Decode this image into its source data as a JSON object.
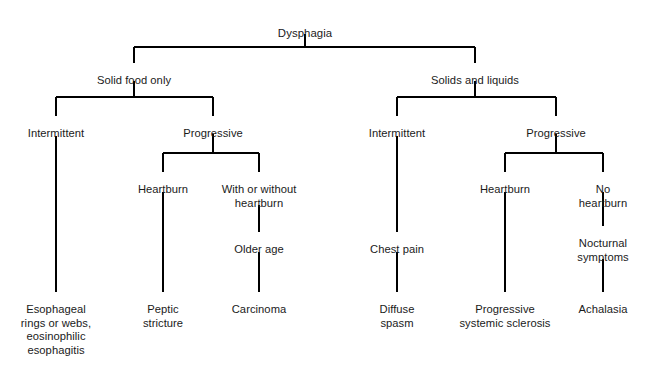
{
  "diagram": {
    "title": "Dysphagia",
    "type": "decision-tree",
    "colors": {
      "text": "#1a1a1a",
      "connector": "#000000",
      "background": "#ffffff"
    },
    "nodes": [
      {
        "id": "dysphagia",
        "label": "Dysphagia",
        "x": 305,
        "y": 27,
        "level": 0
      },
      {
        "id": "solid-food-only",
        "label": "Solid food only",
        "x": 134,
        "y": 74,
        "level": 1
      },
      {
        "id": "solids-and-liquids",
        "label": "Solids and liquids",
        "x": 475,
        "y": 74,
        "level": 1
      },
      {
        "id": "left-intermittent",
        "label": "Intermittent",
        "x": 56,
        "y": 127,
        "level": 2
      },
      {
        "id": "left-progressive",
        "label": "Progressive",
        "x": 213,
        "y": 127,
        "level": 2
      },
      {
        "id": "right-intermittent",
        "label": "Intermittent",
        "x": 397,
        "y": 127,
        "level": 2
      },
      {
        "id": "right-progressive",
        "label": "Progressive",
        "x": 556,
        "y": 127,
        "level": 2
      },
      {
        "id": "left-heartburn",
        "label": "Heartburn",
        "x": 163,
        "y": 183,
        "level": 3
      },
      {
        "id": "with-or-without",
        "label": "With or without\nheartburn",
        "x": 259,
        "y": 183,
        "level": 3
      },
      {
        "id": "right-heartburn",
        "label": "Heartburn",
        "x": 505,
        "y": 183,
        "level": 3
      },
      {
        "id": "no-heartburn",
        "label": "No heartburn",
        "x": 603,
        "y": 183,
        "level": 3
      },
      {
        "id": "older-age",
        "label": "Older age",
        "x": 259,
        "y": 243,
        "level": 4
      },
      {
        "id": "chest-pain",
        "label": "Chest pain",
        "x": 397,
        "y": 243,
        "level": 4
      },
      {
        "id": "nocturnal-symptoms",
        "label": "Nocturnal\nsymptoms",
        "x": 603,
        "y": 237,
        "level": 4
      },
      {
        "id": "esophageal-rings",
        "label": "Esophageal\nrings or webs,\neosinophilic\nesophagitis",
        "x": 56,
        "y": 303,
        "level": 5
      },
      {
        "id": "peptic-stricture",
        "label": "Peptic\nstricture",
        "x": 163,
        "y": 303,
        "level": 5
      },
      {
        "id": "carcinoma",
        "label": "Carcinoma",
        "x": 259,
        "y": 303,
        "level": 5
      },
      {
        "id": "diffuse-spasm",
        "label": "Diffuse\nspasm",
        "x": 397,
        "y": 303,
        "level": 5
      },
      {
        "id": "progressive-systemic",
        "label": "Progressive\nsystemic sclerosis",
        "x": 505,
        "y": 303,
        "level": 5
      },
      {
        "id": "achalasia",
        "label": "Achalasia",
        "x": 603,
        "y": 303,
        "level": 5
      }
    ],
    "connectors": [
      {
        "id": "root-stem",
        "type": "vline",
        "x": 305,
        "y1": 34,
        "y2": 47
      },
      {
        "id": "root-split-bar",
        "type": "hline",
        "x1": 134,
        "x2": 475,
        "y": 47
      },
      {
        "id": "to-solid-food-only",
        "type": "vline",
        "x": 134,
        "y1": 47,
        "y2": 63
      },
      {
        "id": "to-solids-and-liquids",
        "type": "vline",
        "x": 475,
        "y1": 47,
        "y2": 63
      },
      {
        "id": "left-stem",
        "type": "vline",
        "x": 134,
        "y1": 81,
        "y2": 97
      },
      {
        "id": "left-split-bar",
        "type": "hline",
        "x1": 56,
        "x2": 213,
        "y": 97
      },
      {
        "id": "to-left-intermittent",
        "type": "vline",
        "x": 56,
        "y1": 97,
        "y2": 116
      },
      {
        "id": "to-left-progressive",
        "type": "vline",
        "x": 213,
        "y1": 97,
        "y2": 116
      },
      {
        "id": "right-stem",
        "type": "vline",
        "x": 475,
        "y1": 81,
        "y2": 97
      },
      {
        "id": "right-split-bar",
        "type": "hline",
        "x1": 397,
        "x2": 556,
        "y": 97
      },
      {
        "id": "to-right-intermittent",
        "type": "vline",
        "x": 397,
        "y1": 97,
        "y2": 116
      },
      {
        "id": "to-right-progressive",
        "type": "vline",
        "x": 556,
        "y1": 97,
        "y2": 116
      },
      {
        "id": "left-prog-stem",
        "type": "vline",
        "x": 213,
        "y1": 134,
        "y2": 153
      },
      {
        "id": "left-prog-bar",
        "type": "hline",
        "x1": 163,
        "x2": 259,
        "y": 153
      },
      {
        "id": "to-left-heartburn",
        "type": "vline",
        "x": 163,
        "y1": 153,
        "y2": 172
      },
      {
        "id": "to-with-or-without",
        "type": "vline",
        "x": 259,
        "y1": 153,
        "y2": 172
      },
      {
        "id": "right-prog-stem",
        "type": "vline",
        "x": 556,
        "y1": 134,
        "y2": 153
      },
      {
        "id": "right-prog-bar",
        "type": "hline",
        "x1": 505,
        "x2": 603,
        "y": 153
      },
      {
        "id": "to-right-heartburn",
        "type": "vline",
        "x": 505,
        "y1": 153,
        "y2": 172
      },
      {
        "id": "to-no-heartburn",
        "type": "vline",
        "x": 603,
        "y1": 153,
        "y2": 172
      },
      {
        "id": "left-interm-drop",
        "type": "vline",
        "x": 56,
        "y1": 136,
        "y2": 292
      },
      {
        "id": "left-heartburn-drop",
        "type": "vline",
        "x": 163,
        "y1": 192,
        "y2": 292
      },
      {
        "id": "with-without-to-older",
        "type": "vline",
        "x": 259,
        "y1": 205,
        "y2": 232
      },
      {
        "id": "older-to-carcinoma",
        "type": "vline",
        "x": 259,
        "y1": 252,
        "y2": 292
      },
      {
        "id": "right-interm-drop",
        "type": "vline",
        "x": 397,
        "y1": 136,
        "y2": 232
      },
      {
        "id": "chest-to-diffuse",
        "type": "vline",
        "x": 397,
        "y1": 252,
        "y2": 292
      },
      {
        "id": "right-heartburn-drop",
        "type": "vline",
        "x": 505,
        "y1": 192,
        "y2": 292
      },
      {
        "id": "no-heartburn-to-noct",
        "type": "vline",
        "x": 603,
        "y1": 192,
        "y2": 226
      },
      {
        "id": "noct-to-achalasia",
        "type": "vline",
        "x": 603,
        "y1": 259,
        "y2": 292
      }
    ]
  }
}
